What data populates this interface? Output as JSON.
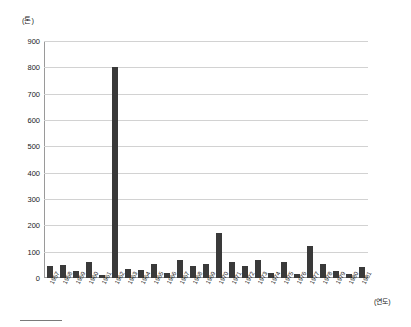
{
  "chart_data": {
    "type": "bar",
    "title": "",
    "subtitle": "",
    "unit_label": "(톤)",
    "xlabel": "(연도)",
    "ylabel": "",
    "ylim": [
      0,
      900
    ],
    "ytick_step": 100,
    "yticks": [
      0,
      100,
      200,
      300,
      400,
      500,
      600,
      700,
      800,
      900
    ],
    "ytick_labels": [
      "0",
      "100",
      "200",
      "300",
      "400",
      "500",
      "600",
      "700",
      "800",
      "900"
    ],
    "grid": true,
    "legend": false,
    "legend_position": "none",
    "bar_color": "#3a3a3a",
    "categories": [
      "1957",
      "1958",
      "1959",
      "1960",
      "1961",
      "1962",
      "1963",
      "1964",
      "1965",
      "1966",
      "1967",
      "1968",
      "1969",
      "1970",
      "1971",
      "1972",
      "1973",
      "1974",
      "1975",
      "1976",
      "1977",
      "1978",
      "1979",
      "1980",
      "1981"
    ],
    "values": [
      45,
      50,
      25,
      60,
      10,
      800,
      35,
      30,
      55,
      20,
      70,
      45,
      55,
      170,
      60,
      45,
      70,
      20,
      60,
      15,
      120,
      55,
      25,
      15,
      40
    ]
  }
}
